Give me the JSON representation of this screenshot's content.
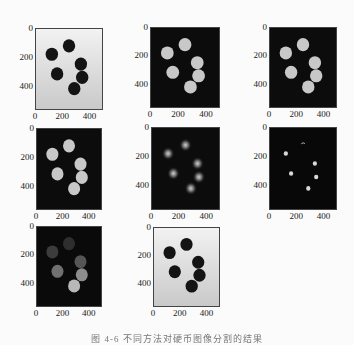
{
  "figure": {
    "caption": "图 4-6  不同方法对硬币图像分割的结果",
    "axes": {
      "y_ticks": [
        "0",
        "200",
        "400"
      ],
      "x_ticks": [
        "0",
        "200",
        "400"
      ]
    },
    "panels": [
      {
        "id": "original",
        "style": "grayscale coins: dark coins on light background"
      },
      {
        "id": "binary",
        "style": "light coins on black background"
      },
      {
        "id": "binary-filled",
        "style": "light coins on black background"
      },
      {
        "id": "binary-cleaned",
        "style": "light coins on black background"
      },
      {
        "id": "distance-transform",
        "style": "faint glowing blobs on black"
      },
      {
        "id": "markers",
        "style": "small bright dots on black"
      },
      {
        "id": "labels",
        "style": "coins in graded gray levels on black"
      },
      {
        "id": "segmented-result",
        "style": "dark coins on light background"
      }
    ],
    "coins": [
      {
        "x": 250,
        "y": 120
      },
      {
        "x": 120,
        "y": 180
      },
      {
        "x": 340,
        "y": 250
      },
      {
        "x": 160,
        "y": 320
      },
      {
        "x": 350,
        "y": 345
      },
      {
        "x": 290,
        "y": 425
      }
    ],
    "label_grays": [
      "#2e2e2e",
      "#3c3c3c",
      "#555555",
      "#707070",
      "#8c8c8c",
      "#b8b8b8"
    ]
  }
}
